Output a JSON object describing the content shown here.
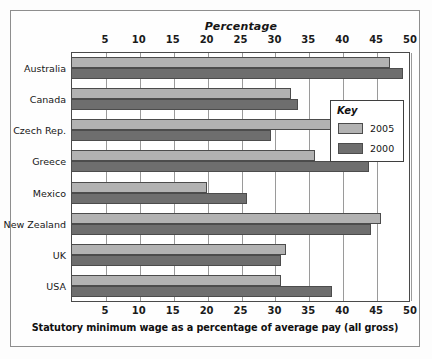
{
  "chart_data": {
    "type": "bar",
    "orientation": "horizontal",
    "title": "Percentage",
    "caption": "Statutory minimum wage as a percentage of average pay (all gross)",
    "xlabel": "Percentage",
    "ylabel": "",
    "xlim": [
      0,
      50
    ],
    "xticks": [
      5,
      10,
      15,
      20,
      25,
      30,
      35,
      40,
      45,
      50
    ],
    "xtick_labels": [
      "5",
      "10",
      "15",
      "20",
      "25",
      "30",
      "35",
      "40",
      "45",
      "50"
    ],
    "grid": true,
    "grid_axis": "x",
    "axis_top": true,
    "axis_bottom": true,
    "legend_title": "Key",
    "legend_position": "right-upper",
    "categories": [
      "Australia",
      "Canada",
      "Czech Rep.",
      "Greece",
      "Mexico",
      "New Zealand",
      "UK",
      "USA"
    ],
    "series": [
      {
        "name": "2005",
        "color": "#b2b2b2",
        "values": [
          47.0,
          32.5,
          38.5,
          36.0,
          20.0,
          45.7,
          31.7,
          31.0
        ]
      },
      {
        "name": "2000",
        "color": "#6e6e6e",
        "values": [
          49.0,
          33.5,
          29.5,
          44.0,
          26.0,
          44.2,
          31.0,
          38.5
        ]
      }
    ]
  },
  "colors": {
    "series_2005": "#b2b2b2",
    "series_2000": "#6e6e6e",
    "bar_outline": "#4c4c4c",
    "gridline": "#9a9a9a",
    "frame": "#8e8e8e",
    "text": "#161616",
    "background": "#ffffff"
  }
}
